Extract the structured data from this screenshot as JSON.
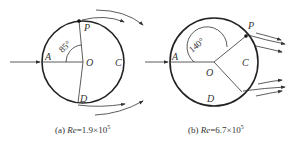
{
  "figures": [
    {
      "id": "a",
      "caption_prefix": "(a) ",
      "caption_re": "Re",
      "caption_value": "=1.9×10",
      "caption_exp": "5",
      "angle_label": "85°",
      "points": {
        "A": "A",
        "O": "O",
        "C": "C",
        "P": "P",
        "D": "D"
      }
    },
    {
      "id": "b",
      "caption_prefix": "(b) ",
      "caption_re": "Re",
      "caption_value": "=6.7×10",
      "caption_exp": "5",
      "angle_label": "140°",
      "points": {
        "A": "A",
        "O": "O",
        "C": "C",
        "P": "P",
        "D": "D"
      }
    }
  ],
  "colors": {
    "stroke": "#222222",
    "text": "#333333"
  }
}
